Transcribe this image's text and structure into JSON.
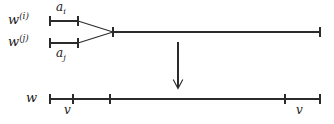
{
  "figure": {
    "type": "tree-merge-diagram",
    "background_color": "#ffffff",
    "stroke_color": "#2b2b2b",
    "labels": {
      "w_i_base": "w",
      "w_i_sup": "(i)",
      "w_j_base": "w",
      "w_j_sup": "(j)",
      "w_base": "w",
      "a_i_base": "a",
      "a_i_sub": "i",
      "a_j_base": "a",
      "a_j_sub": "j",
      "v_left": "v",
      "v_right": "v"
    },
    "icons": {
      "down_arrow": "down-arrow-icon"
    },
    "geometry": {
      "branch_i_y": 21,
      "branch_j_y": 43,
      "merged_y": 32,
      "bottom_y": 99,
      "segment_start_x": 50,
      "segment_end_x": 78,
      "vertex_x": 113,
      "line_end_x": 320,
      "arrow_x": 178,
      "arrow_y_start": 42,
      "arrow_y_end": 88,
      "bottom_ticks": [
        50,
        73,
        110,
        285,
        320
      ],
      "tick_half_height": 5
    }
  }
}
